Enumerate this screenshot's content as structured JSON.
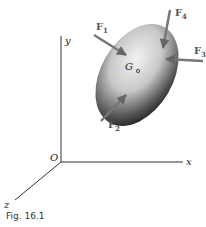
{
  "figure": {
    "caption": "Fig. 16.1",
    "axes": {
      "x": "x",
      "y": "y",
      "z": "z",
      "origin": "O"
    },
    "center_of_mass_label": "G",
    "forces": [
      {
        "name": "F",
        "sub": "1"
      },
      {
        "name": "F",
        "sub": "2"
      },
      {
        "name": "F",
        "sub": "3"
      },
      {
        "name": "F",
        "sub": "4"
      }
    ],
    "colors": {
      "axis": "#333333",
      "force_arrow": "#777777",
      "body_dark": "#222222",
      "body_light": "#e8e8e8"
    }
  }
}
